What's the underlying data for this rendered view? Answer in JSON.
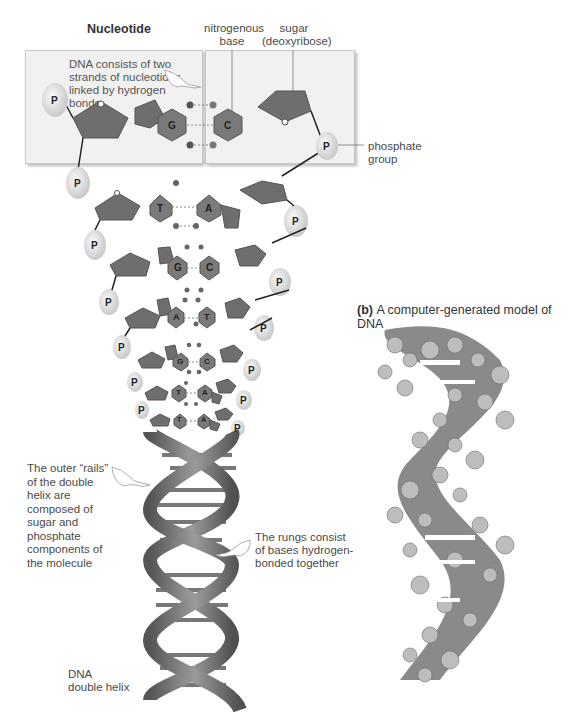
{
  "diagram": {
    "title": "Nucleotide",
    "labels": {
      "nitrogenous_base": "nitrogenous base",
      "nitrogenous_base_line1": "nitrogenous",
      "nitrogenous_base_line2": "base",
      "sugar_line1": "sugar",
      "sugar_line2": "(deoxyribose)",
      "phosphate_line1": "phosphate",
      "phosphate_line2": "group"
    },
    "callouts": {
      "strands": [
        "DNA consists of two",
        "strands of nucleotides",
        "linked by hydrogen",
        "bonds"
      ],
      "rails": [
        "The outer “rails”",
        "of the double",
        "helix are",
        "composed of",
        "sugar and",
        "phosphate",
        "components of",
        "the molecule"
      ],
      "rungs": [
        "The rungs consist",
        "of bases hydrogen-",
        "bonded together"
      ],
      "helix": [
        "DNA",
        "double helix"
      ]
    },
    "phosphate_symbol": "P",
    "base_pairs": [
      {
        "left": "G",
        "right": "C"
      },
      {
        "left": "T",
        "right": "A"
      },
      {
        "left": "G",
        "right": "C"
      },
      {
        "left": "A",
        "right": "T"
      },
      {
        "left": "G",
        "right": "C"
      },
      {
        "left": "T",
        "right": "A"
      },
      {
        "left": "T",
        "right": "A"
      }
    ],
    "model_caption": {
      "tag": "(b)",
      "text": "A computer-generated model of DNA"
    },
    "colors": {
      "sugar": "#6e6e6e",
      "base": "#7a7a7a",
      "phosphate": "#e4e4e4",
      "box": "#f1f1f1",
      "helix": "#6a6a6a"
    }
  }
}
